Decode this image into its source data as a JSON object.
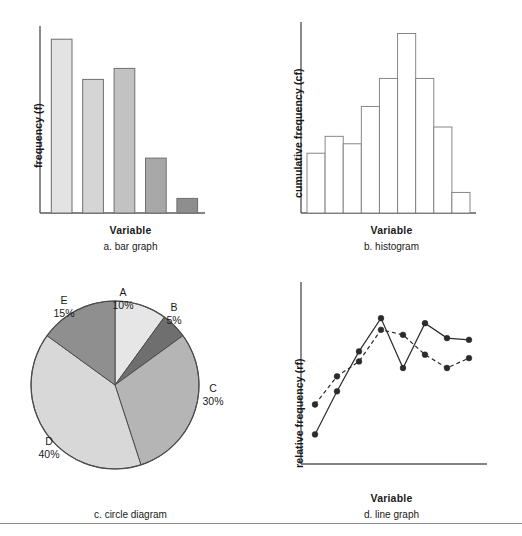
{
  "figure": {
    "panels": [
      {
        "id": "a",
        "caption": "a. bar graph",
        "xlabel": "Variable",
        "ylabel": "frequency (f)"
      },
      {
        "id": "b",
        "caption": "b. histogram",
        "xlabel": "Variable",
        "ylabel": "cumulative frequency (cf)"
      },
      {
        "id": "c",
        "caption": "c. circle diagram",
        "xlabel": "",
        "ylabel": ""
      },
      {
        "id": "d",
        "caption": "d. line graph",
        "xlabel": "Variable",
        "ylabel": "relative frequency (rf)"
      }
    ]
  },
  "chart_data": [
    {
      "type": "bar",
      "panel": "a",
      "title": "a. bar graph",
      "xlabel": "Variable",
      "ylabel": "frequency (f)",
      "categories": [
        "1",
        "2",
        "3",
        "4",
        "5"
      ],
      "values": [
        95,
        73,
        79,
        30,
        8
      ],
      "ylim": [
        0,
        100
      ],
      "grid": false,
      "legend": "none",
      "bar_colors": [
        "#e3e3e3",
        "#d5d5d5",
        "#c2c2c2",
        "#a8a8a8",
        "#8e8e8e"
      ],
      "bar_border": "#6e6e6e",
      "axis_color": "#5a5a5a",
      "gap_between_bars": true
    },
    {
      "type": "bar",
      "panel": "b",
      "title": "b. histogram",
      "xlabel": "Variable",
      "ylabel": "cumulative frequency (cf)",
      "categories": [
        "1",
        "2",
        "3",
        "4",
        "5",
        "6",
        "7",
        "8",
        "9"
      ],
      "values": [
        32,
        41,
        37,
        57,
        72,
        96,
        72,
        46,
        11
      ],
      "ylim": [
        0,
        100
      ],
      "grid": false,
      "legend": "none",
      "bar_fill": "#ffffff",
      "bar_border": "#7a7a7a",
      "axis_color": "#5a5a5a",
      "gap_between_bars": false
    },
    {
      "type": "pie",
      "panel": "c",
      "title": "c. circle diagram",
      "labels": [
        "A",
        "B",
        "C",
        "D",
        "E"
      ],
      "values": [
        10,
        5,
        30,
        40,
        15
      ],
      "value_labels": [
        "10%",
        "5%",
        "30%",
        "40%",
        "15%"
      ],
      "colors": [
        "#e6e6e6",
        "#6f6f6f",
        "#b5b5b5",
        "#d8d8d8",
        "#8f8f8f"
      ],
      "slice_border": "#4d4d4d",
      "legend": "outside-labels",
      "start_angle_deg": -90
    },
    {
      "type": "line",
      "panel": "d",
      "title": "d. line graph",
      "xlabel": "Variable",
      "ylabel": "relative frequency (rf)",
      "x": [
        1,
        2,
        3,
        4,
        5,
        6,
        7,
        8
      ],
      "ylim": [
        0,
        100
      ],
      "grid": false,
      "legend": "none",
      "marker": "filled-circle",
      "marker_color": "#2b2b2b",
      "axis_color": "#5a5a5a",
      "series": [
        {
          "name": "solid",
          "style": "solid",
          "values": [
            13,
            39,
            63,
            83,
            53,
            80,
            71,
            70
          ]
        },
        {
          "name": "dashed",
          "style": "dashed",
          "values": [
            31,
            48,
            57,
            76,
            73,
            61,
            53,
            59
          ]
        }
      ]
    }
  ]
}
